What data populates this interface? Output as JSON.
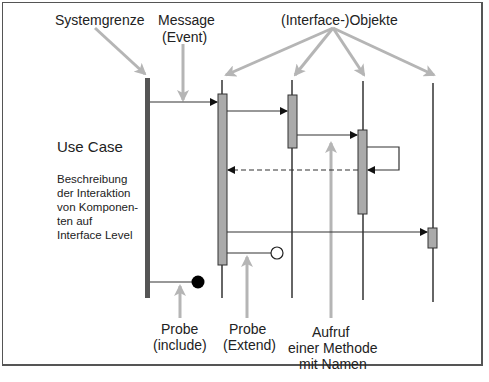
{
  "diagram": {
    "type": "sequence-diagram-annotation",
    "colors": {
      "frame": "#555555",
      "system_boundary": "#555555",
      "lifeline": "#666666",
      "activation_fill": "#aaaaaa",
      "activation_stroke": "#333333",
      "message": "#333333",
      "annotation_arrow": "#b5b5b5",
      "text": "#222222"
    },
    "top_labels": {
      "systemgrenze": "Systemgrenze",
      "message_line1": "Message",
      "message_line2": "(Event)",
      "objects": "(Interface-)Objekte"
    },
    "left_text": {
      "title": "Use Case",
      "desc_lines": [
        "Beschreibung",
        "der Interaktion",
        "von Komponen-",
        "ten auf",
        "Interface Level"
      ]
    },
    "bottom_labels": {
      "probe_include_line1": "Probe",
      "probe_include_line2": "(include)",
      "probe_extend_line1": "Probe",
      "probe_extend_line2": "(Extend)",
      "method_line1": "Aufruf",
      "method_line2": "einer Methode",
      "method_line3": "mit Namen"
    },
    "lifelines": [
      {
        "name": "object-1",
        "x": 222,
        "activations": [
          [
            94,
            265
          ]
        ]
      },
      {
        "name": "object-2",
        "x": 292,
        "activations": [
          [
            95,
            148
          ]
        ]
      },
      {
        "name": "object-3",
        "x": 363,
        "activations": [
          [
            130,
            214
          ]
        ]
      },
      {
        "name": "object-4",
        "x": 433,
        "activations": [
          [
            228,
            248
          ]
        ]
      }
    ],
    "messages": [
      {
        "from": "system-boundary",
        "to": "object-1",
        "style": "solid",
        "y": 102
      },
      {
        "from": "object-1",
        "to": "object-2",
        "style": "solid",
        "y": 111
      },
      {
        "from": "object-2",
        "to": "object-3",
        "style": "solid",
        "y": 135
      },
      {
        "from": "object-3",
        "to": "object-3",
        "style": "self-call",
        "y": 147
      },
      {
        "from": "object-3",
        "to": "object-1",
        "style": "dashed-return",
        "y": 170
      },
      {
        "from": "object-1",
        "to": "object-4",
        "style": "solid",
        "y": 232
      }
    ],
    "probes": [
      {
        "kind": "include",
        "marker": "filled-circle",
        "from": "system-boundary",
        "y": 282
      },
      {
        "kind": "extend",
        "marker": "open-circle",
        "from": "object-1",
        "y": 253
      }
    ]
  }
}
